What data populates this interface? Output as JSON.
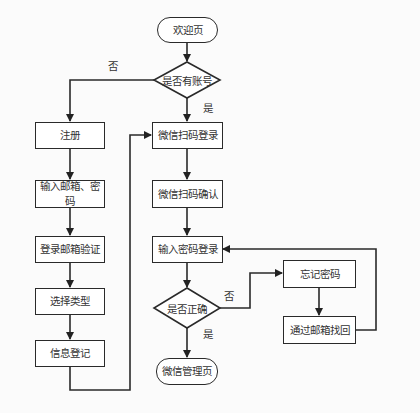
{
  "diagram": {
    "type": "flowchart",
    "nodes": {
      "welcome": "欢迎页",
      "has_account": "是否有账号",
      "register": "注册",
      "input_email_password": "输入邮箱、密码",
      "email_verify": "登录邮箱验证",
      "select_type": "选择类型",
      "info_register": "信息登记",
      "wechat_scan_login": "微信扫码登录",
      "wechat_scan_confirm": "微信扫码确认",
      "input_password_login": "输入密码登录",
      "is_correct": "是否正确",
      "wechat_admin_page": "微信管理页",
      "forgot_password": "忘记密码",
      "recover_by_email": "通过邮箱找回"
    },
    "edge_labels": {
      "has_account_no": "否",
      "has_account_yes": "是",
      "is_correct_no": "否",
      "is_correct_yes": "是"
    },
    "edges": [
      {
        "from": "welcome",
        "to": "has_account"
      },
      {
        "from": "has_account",
        "to": "register",
        "label": "否"
      },
      {
        "from": "has_account",
        "to": "wechat_scan_login",
        "label": "是"
      },
      {
        "from": "register",
        "to": "input_email_password"
      },
      {
        "from": "input_email_password",
        "to": "email_verify"
      },
      {
        "from": "email_verify",
        "to": "select_type"
      },
      {
        "from": "select_type",
        "to": "info_register"
      },
      {
        "from": "info_register",
        "to": "wechat_scan_login"
      },
      {
        "from": "wechat_scan_login",
        "to": "wechat_scan_confirm"
      },
      {
        "from": "wechat_scan_confirm",
        "to": "input_password_login"
      },
      {
        "from": "input_password_login",
        "to": "is_correct"
      },
      {
        "from": "is_correct",
        "to": "wechat_admin_page",
        "label": "是"
      },
      {
        "from": "is_correct",
        "to": "forgot_password",
        "label": "否"
      },
      {
        "from": "forgot_password",
        "to": "recover_by_email"
      },
      {
        "from": "recover_by_email",
        "to": "input_password_login"
      }
    ]
  }
}
